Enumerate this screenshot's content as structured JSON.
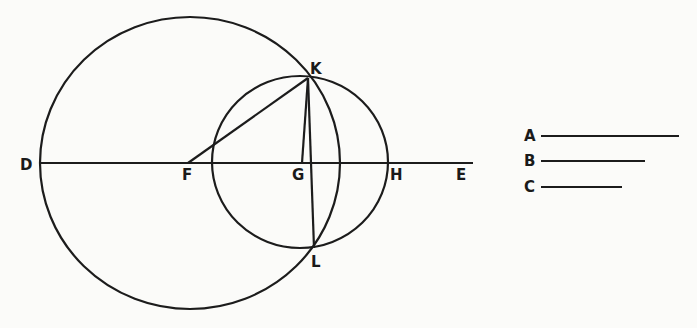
{
  "diagram": {
    "colors": {
      "ink": "#1c1c1c",
      "paper": "#fbfbf9"
    },
    "points": {
      "D": {
        "label": "D",
        "x": 40,
        "y": 163
      },
      "F": {
        "label": "F",
        "x": 188,
        "y": 163
      },
      "G": {
        "label": "G",
        "x": 302,
        "y": 163
      },
      "H": {
        "label": "H",
        "x": 386,
        "y": 163
      },
      "E": {
        "label": "E",
        "x": 473,
        "y": 163
      },
      "K": {
        "label": "K",
        "x": 308,
        "y": 78
      },
      "L": {
        "label": "L",
        "x": 314,
        "y": 248
      }
    },
    "circles": [
      {
        "name": "large-circle",
        "cx": 190,
        "cy": 163,
        "rx": 150,
        "ry": 146
      },
      {
        "name": "small-circle",
        "cx": 300,
        "cy": 162,
        "rx": 88,
        "ry": 86
      }
    ],
    "segments": [
      {
        "name": "line-DE",
        "from": "D",
        "to": "E"
      },
      {
        "name": "line-FK",
        "from": "F",
        "to": "K"
      },
      {
        "name": "line-GK",
        "from": "G",
        "to": "K"
      },
      {
        "name": "line-KL",
        "from": "K",
        "to": "L"
      }
    ],
    "legend": [
      {
        "label": "A",
        "length": 138
      },
      {
        "label": "B",
        "length": 104
      },
      {
        "label": "C",
        "length": 80
      }
    ]
  }
}
